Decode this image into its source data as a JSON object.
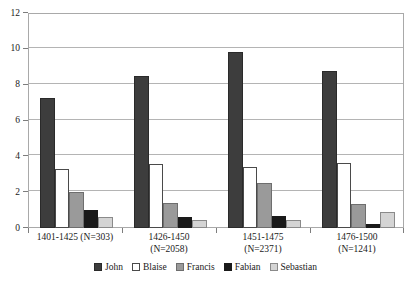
{
  "chart_data": {
    "type": "bar",
    "title": "",
    "subtitle": "",
    "xlabel": "",
    "ylabel": "",
    "ylim": [
      0,
      12
    ],
    "yticks": [
      0,
      2,
      4,
      6,
      8,
      10,
      12
    ],
    "ytick_labels": [
      "0",
      "2",
      "4",
      "6",
      "8",
      "10",
      "12"
    ],
    "grid": true,
    "grid_axis": "y",
    "legend_position": "bottom-center",
    "categories": [
      "1401-1425 (N=303)",
      "1426-1450 (N=2058)",
      "1451-1475 (N=2371)",
      "1476-1500 (N=1241)"
    ],
    "category_lines": [
      [
        "1401-1425 (N=303)"
      ],
      [
        "1426-1450",
        "(N=2058)"
      ],
      [
        "1451-1475",
        "(N=2371)"
      ],
      [
        "1476-1500",
        "(N=1241)"
      ]
    ],
    "series": [
      {
        "name": "John",
        "color": "#3d3d3d",
        "border": "#2a2a2a",
        "values": [
          7.25,
          8.5,
          9.8,
          8.75
        ]
      },
      {
        "name": "Blaise",
        "color": "#ffffff",
        "border": "#4a4a4a",
        "values": [
          3.3,
          3.6,
          3.4,
          3.65
        ]
      },
      {
        "name": "Francis",
        "color": "#9a9a9a",
        "border": "#6e6e6e",
        "values": [
          2.0,
          1.4,
          2.5,
          1.35
        ]
      },
      {
        "name": "Fabian",
        "color": "#1a1a1a",
        "border": "#1a1a1a",
        "values": [
          1.0,
          0.6,
          0.65,
          0.25
        ]
      },
      {
        "name": "Sebastian",
        "color": "#d4d4d4",
        "border": "#8a8a8a",
        "values": [
          0.6,
          0.45,
          0.45,
          0.9
        ]
      }
    ]
  },
  "legend": {
    "items": [
      {
        "label": "John"
      },
      {
        "label": "Blaise"
      },
      {
        "label": "Francis"
      },
      {
        "label": "Fabian"
      },
      {
        "label": "Sebastian"
      }
    ]
  },
  "axes": {
    "y": {
      "tick_labels": [
        "0",
        "2",
        "4",
        "6",
        "8",
        "10",
        "12"
      ]
    }
  }
}
